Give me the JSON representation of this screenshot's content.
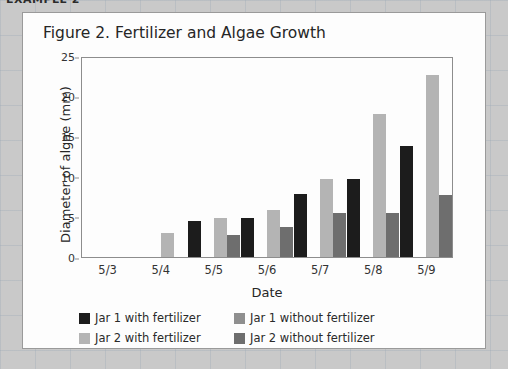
{
  "top_label": "EXAMPLE 2",
  "card": {
    "title": "Figure 2. Fertilizer and Algae Growth"
  },
  "axes": {
    "y_title": "Diameter of algae (mm)",
    "x_title": "Date",
    "y_ticks": [
      "0",
      "5",
      "10",
      "15",
      "20",
      "25"
    ]
  },
  "legend": [
    {
      "label": "Jar 1 with fertilizer",
      "color": "#1c1c1c"
    },
    {
      "label": "Jar 1 without fertilizer",
      "color": "#8f8f8f"
    },
    {
      "label": "Jar 2 with fertilizer",
      "color": "#b4b4b4"
    },
    {
      "label": "Jar 2 without fertilizer",
      "color": "#6e6e6e"
    }
  ],
  "chart_data": {
    "type": "bar",
    "title": "Figure 2. Fertilizer and Algae Growth",
    "xlabel": "Date",
    "ylabel": "Diameter of algae (mm)",
    "ylim": [
      0,
      25
    ],
    "ytick_step": 5,
    "grid": false,
    "legend_position": "bottom",
    "categories": [
      "5/3",
      "5/4",
      "5/5",
      "5/6",
      "5/7",
      "5/8",
      "5/9"
    ],
    "series": [
      {
        "name": "Jar 1 with fertilizer",
        "color": "#1c1c1c",
        "values": [
          0,
          0,
          4.5,
          4.8,
          7.8,
          9.7,
          13.8
        ]
      },
      {
        "name": "Jar 1 without fertilizer",
        "color": "#8f8f8f",
        "values": [
          0,
          0,
          0,
          0,
          0,
          0,
          0
        ]
      },
      {
        "name": "Jar 2 with fertilizer",
        "color": "#b4b4b4",
        "values": [
          0,
          3.0,
          4.8,
          5.8,
          9.7,
          17.8,
          22.7
        ]
      },
      {
        "name": "Jar 2 without fertilizer",
        "color": "#6e6e6e",
        "values": [
          0,
          0,
          2.8,
          3.7,
          5.5,
          5.5,
          7.7
        ]
      }
    ]
  }
}
